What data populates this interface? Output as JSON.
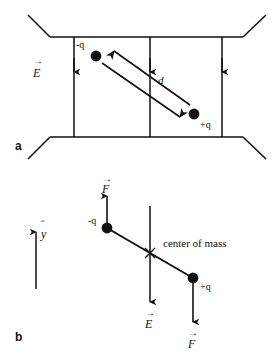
{
  "figure": {
    "title_alt": "Electric dipole in a uniform electric field",
    "stroke_color": "#111111",
    "background_color": "#ffffff"
  },
  "panels": [
    {
      "id": "a",
      "label": "a",
      "description": "Dipole of separation d tilted inside a parallel-plate capacitor with uniform downward field E",
      "field_label": "E",
      "field_direction": "down",
      "field_line_count": 3,
      "separation_label": "d",
      "charges": [
        {
          "name": "negative-charge",
          "label": "-q",
          "x": 96,
          "y": 56
        },
        {
          "name": "positive-charge",
          "label": "+q",
          "x": 194,
          "y": 114
        }
      ],
      "plates": {
        "top_y": 37,
        "bottom_y": 137,
        "left_x": 50,
        "right_x": 243
      },
      "field_lines_x": [
        74,
        150,
        222
      ]
    },
    {
      "id": "b",
      "label": "b",
      "description": "Free-body view: forces F on each charge, field E downward, center of mass marked",
      "unit_vector_label": "y",
      "unit_vector_direction": "up",
      "field_label": "E",
      "field_direction": "down",
      "force_label": "F",
      "center_of_mass_label": "center of mass",
      "charges": [
        {
          "name": "negative-charge",
          "label": "-q",
          "x": 107,
          "y": 228,
          "force_direction": "up"
        },
        {
          "name": "positive-charge",
          "label": "+q",
          "x": 193,
          "y": 278,
          "force_direction": "down"
        }
      ],
      "center_of_mass": {
        "x": 150,
        "y": 253
      }
    }
  ],
  "labels": {
    "panel_a": "a",
    "panel_b": "b",
    "neg_charge": "-q",
    "pos_charge": "+q",
    "separation": "d",
    "field": "E",
    "force": "F",
    "unit_y": "y",
    "center_of_mass": "center of mass"
  }
}
